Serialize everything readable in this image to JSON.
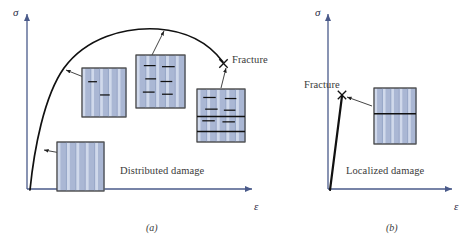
{
  "figure": {
    "panels": [
      {
        "id": "a",
        "caption": "(a)",
        "caption_x": 146,
        "caption_y": 222,
        "regime_label": "Distributed damage",
        "regime_x": 120,
        "regime_y": 165,
        "fracture_label": "Fracture",
        "fracture_label_x": 232,
        "fracture_label_y": 54,
        "axis": {
          "y_label": "σ",
          "y_label_x": 13,
          "y_label_y": 6,
          "x_label": "ε",
          "x_label_x": 254,
          "x_label_y": 200,
          "origin_x": 27,
          "origin_y": 189,
          "x_end": 252,
          "y_top": 14,
          "color": "#4a5a8a"
        },
        "curve": {
          "color": "#111111",
          "width": 1.7,
          "path": "M 30 190 C 34 150, 44 96, 64 68 C 86 38, 124 27, 158 29 C 186 31, 208 42, 223 62",
          "fracture_marker": {
            "x": 223.5,
            "y": 63.5,
            "size": 4.2
          }
        },
        "leaders": [
          {
            "from_x": 72,
            "from_y": 155,
            "to_x": 44,
            "to_y": 150
          },
          {
            "from_x": 96,
            "from_y": 82,
            "to_x": 66,
            "to_y": 70
          },
          {
            "from_x": 152,
            "from_y": 55,
            "to_x": 164,
            "to_y": 31
          },
          {
            "from_x": 221,
            "from_y": 88,
            "to_x": 226,
            "to_y": 68
          }
        ],
        "specimens": [
          {
            "name": "specimen-undamaged",
            "x": 57,
            "y": 142,
            "w": 47,
            "h": 49,
            "cracks": []
          },
          {
            "name": "specimen-early-damage",
            "x": 82,
            "y": 68,
            "w": 44,
            "h": 49,
            "cracks": [
              {
                "cx": 0.24,
                "cy": 0.28,
                "len": 0.2
              },
              {
                "cx": 0.52,
                "cy": 0.55,
                "len": 0.22
              }
            ]
          },
          {
            "name": "specimen-distributed-damage",
            "x": 136,
            "y": 55,
            "w": 49,
            "h": 53,
            "cracks": [
              {
                "cx": 0.28,
                "cy": 0.2,
                "len": 0.24
              },
              {
                "cx": 0.66,
                "cy": 0.22,
                "len": 0.26
              },
              {
                "cx": 0.3,
                "cy": 0.45,
                "len": 0.22
              },
              {
                "cx": 0.62,
                "cy": 0.5,
                "len": 0.24
              },
              {
                "cx": 0.26,
                "cy": 0.7,
                "len": 0.24
              },
              {
                "cx": 0.64,
                "cy": 0.74,
                "len": 0.22
              }
            ]
          },
          {
            "name": "specimen-near-fracture",
            "x": 197,
            "y": 89,
            "w": 48,
            "h": 53,
            "cracks": [
              {
                "cx": 0.26,
                "cy": 0.16,
                "len": 0.26
              },
              {
                "cx": 0.7,
                "cy": 0.18,
                "len": 0.24
              },
              {
                "cx": 0.3,
                "cy": 0.38,
                "len": 0.26
              },
              {
                "cx": 0.68,
                "cy": 0.4,
                "len": 0.24
              },
              {
                "cx": 0.24,
                "cy": 0.6,
                "len": 0.26
              },
              {
                "cx": 0.66,
                "cy": 0.62,
                "len": 0.26
              },
              {
                "cx": 0.5,
                "cy": 0.8,
                "len": 1.0
              },
              {
                "cx": 0.5,
                "cy": 0.52,
                "len": 1.0
              }
            ]
          }
        ]
      },
      {
        "id": "b",
        "caption": "(b)",
        "caption_x": 96,
        "caption_y": 222,
        "regime_label": "Localized damage",
        "regime_x": 56,
        "regime_y": 165,
        "fracture_label": "Fracture",
        "fracture_label_x": 14,
        "fracture_label_y": 79,
        "axis": {
          "y_label": "σ",
          "y_label_x": 25,
          "y_label_y": 6,
          "x_label": "ε",
          "x_label_x": 164,
          "x_label_y": 200,
          "origin_x": 38,
          "origin_y": 189,
          "x_end": 162,
          "y_top": 14,
          "color": "#4a5a8a"
        },
        "curve": {
          "color": "#111111",
          "width": 2.2,
          "path": "M 40 190 L 52 96",
          "fracture_marker": {
            "x": 52,
            "y": 95,
            "size": 4.2
          }
        },
        "leaders": [
          {
            "from_x": 82,
            "from_y": 106,
            "to_x": 57,
            "to_y": 97
          }
        ],
        "specimens": [
          {
            "name": "specimen-localized-fracture",
            "x": 84,
            "y": 88,
            "w": 42,
            "h": 56,
            "cracks": [
              {
                "cx": 0.5,
                "cy": 0.46,
                "len": 1.0
              }
            ]
          }
        ]
      }
    ],
    "specimen_style": {
      "fill": "#aab7d4",
      "stripe_light": "#d7dfee",
      "stripe_dark": "#93a3c4",
      "border": "#4a4a4a",
      "crack": "#111111"
    }
  }
}
